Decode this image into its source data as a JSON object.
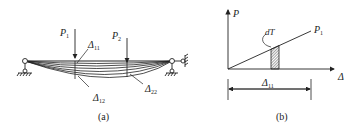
{
  "figure_a": {
    "caption": "(a)",
    "loads": [
      {
        "symbol": "P",
        "sub": "1"
      },
      {
        "symbol": "P",
        "sub": "2"
      }
    ],
    "deflections": [
      {
        "symbol": "Δ",
        "sub": "11"
      },
      {
        "symbol": "Δ",
        "sub": "12"
      },
      {
        "symbol": "Δ",
        "sub": "22"
      }
    ]
  },
  "figure_b": {
    "caption": "(b)",
    "y_axis": "P",
    "x_axis": "Δ",
    "line_label": {
      "symbol": "P",
      "sub": "1"
    },
    "strip_label": "dT",
    "dimension": {
      "symbol": "Δ",
      "sub": "11"
    }
  },
  "colors": {
    "ink": "#222222",
    "background": "#ffffff"
  }
}
